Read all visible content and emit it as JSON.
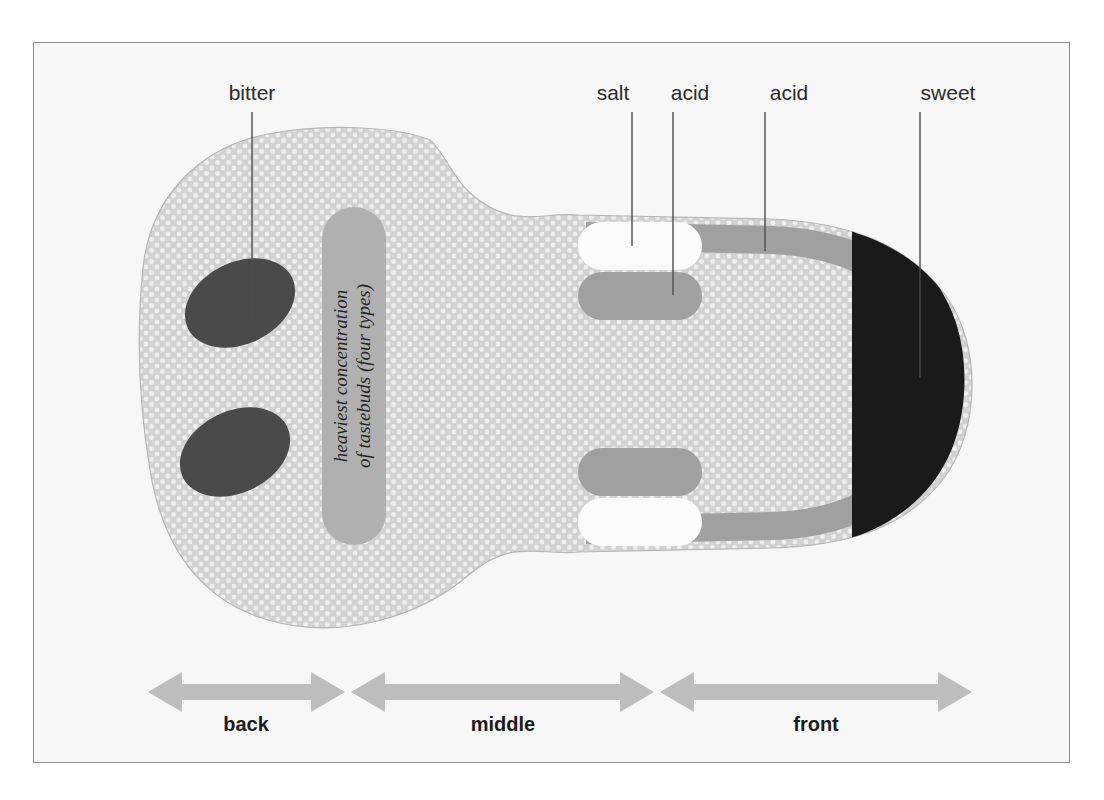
{
  "figure": {
    "kind": "anatomical-diagram",
    "background_color": "#f7f7f7",
    "frame_border_color": "#8c8c8c"
  },
  "colors": {
    "page_background": "#ffffff",
    "panel_background": "#f7f7f7",
    "tongue_body": "#d2d2d2",
    "papillae_dot": "#efefef",
    "papillae_outline": "#b5b5b5",
    "taste_bitter": "#4a4a4a",
    "taste_acid": "#a0a0a0",
    "taste_salt": "#fbfbfb",
    "taste_sweet": "#1a1a1a",
    "concentration_band": "#b0b0b0",
    "arrow": "#bdbdbd",
    "leader_line": "#4d4d4d",
    "label_text": "#2b2b2b"
  },
  "callouts": [
    {
      "id": "bitter",
      "label": "bitter",
      "label_x": 252,
      "label_y": 100,
      "line_x": 252,
      "line_top": 112,
      "line_bottom": 318,
      "target": "bitter-region-upper"
    },
    {
      "id": "salt",
      "label": "salt",
      "label_x": 613,
      "label_y": 100,
      "line_x": 632,
      "line_top": 112,
      "line_bottom": 246,
      "target": "salt-bar-upper"
    },
    {
      "id": "acid1",
      "label": "acid",
      "label_x": 690,
      "label_y": 100,
      "line_x": 673,
      "line_top": 112,
      "line_bottom": 295,
      "target": "acid-bar-upper"
    },
    {
      "id": "acid2",
      "label": "acid",
      "label_x": 789,
      "label_y": 100,
      "line_x": 765,
      "line_top": 112,
      "line_bottom": 251,
      "target": "acid-rim-band"
    },
    {
      "id": "sweet",
      "label": "sweet",
      "label_x": 948,
      "label_y": 100,
      "line_x": 920,
      "line_top": 112,
      "line_bottom": 378,
      "target": "sweet-tip"
    }
  ],
  "concentration_band": {
    "text_line_1": "heaviest concentration",
    "text_line_2": "of tastebuds (four types)",
    "rotation_degrees": -90
  },
  "regions": [
    {
      "id": "bitter-region-upper",
      "taste": "bitter",
      "location": "back of tongue, upper"
    },
    {
      "id": "bitter-region-lower",
      "taste": "bitter",
      "location": "back of tongue, lower"
    },
    {
      "id": "salt-bar-upper",
      "taste": "salt",
      "location": "middle edge, upper"
    },
    {
      "id": "salt-bar-lower",
      "taste": "salt",
      "location": "middle edge, lower"
    },
    {
      "id": "acid-bar-upper",
      "taste": "acid",
      "location": "middle, upper inner"
    },
    {
      "id": "acid-bar-lower",
      "taste": "acid",
      "location": "middle, lower inner"
    },
    {
      "id": "acid-rim-band",
      "taste": "acid",
      "location": "front rim, both sides"
    },
    {
      "id": "sweet-tip",
      "taste": "sweet",
      "location": "tip of tongue"
    }
  ],
  "zone_arrows": [
    {
      "id": "back",
      "label": "back",
      "x1": 148,
      "x2": 345,
      "label_x": 246,
      "label_y": 731
    },
    {
      "id": "middle",
      "label": "middle",
      "x1": 351,
      "x2": 654,
      "label_x": 503,
      "label_y": 731
    },
    {
      "id": "front",
      "label": "front",
      "x1": 660,
      "x2": 972,
      "label_x": 816,
      "label_y": 731
    }
  ],
  "arrow_geometry": {
    "shaft_y": 692,
    "shaft_half_height": 8,
    "head_half_height": 20,
    "head_length": 34
  }
}
